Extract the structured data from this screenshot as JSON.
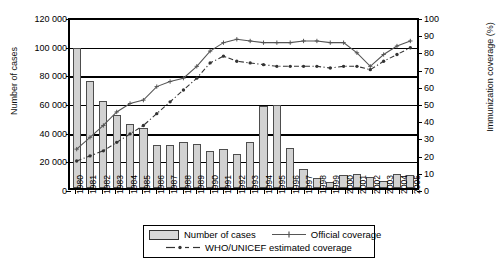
{
  "chart_data": {
    "type": "bar",
    "title": "",
    "xlabel": "",
    "ylabel": "Number of cases",
    "y2label": "Immunization coverage (%)",
    "ylim": [
      0,
      120000
    ],
    "y2lim": [
      0,
      100
    ],
    "grid": true,
    "legend_position": "bottom",
    "categories": [
      "1980",
      "1981",
      "1982",
      "1983",
      "1984",
      "1985",
      "1986",
      "1987",
      "1988",
      "1989",
      "1990",
      "1991",
      "1992",
      "1993",
      "1994",
      "1995",
      "1996",
      "1997",
      "1998",
      "1999",
      "2000",
      "2001",
      "2002",
      "2003",
      "2004",
      "2005"
    ],
    "y_ticks": [
      "0",
      "20 000",
      "40 000",
      "60 000",
      "80 000",
      "100 000",
      "120 000"
    ],
    "y_tick_values": [
      0,
      20000,
      40000,
      60000,
      80000,
      100000,
      120000
    ],
    "y2_ticks": [
      "0",
      "10",
      "20",
      "30",
      "40",
      "50",
      "60",
      "70",
      "80",
      "90",
      "100"
    ],
    "y2_tick_values": [
      0,
      10,
      20,
      30,
      40,
      50,
      60,
      70,
      80,
      90,
      100
    ],
    "series": [
      {
        "name": "Number of cases",
        "type": "bar",
        "axis": "left",
        "color": "#d2d2d2",
        "border_color": "#4d4d4d",
        "values": [
          98000,
          75000,
          61000,
          51000,
          45000,
          42000,
          30000,
          30000,
          32000,
          31000,
          26000,
          27000,
          24000,
          32000,
          57000,
          58000,
          28000,
          13000,
          7000,
          4000,
          9000,
          10000,
          8000,
          5000,
          10000,
          9000
        ]
      },
      {
        "name": "Official coverage",
        "type": "line",
        "axis": "right",
        "color": "#555555",
        "style": "solid",
        "marker": "plus",
        "values": [
          23,
          30,
          37,
          45,
          50,
          52,
          60,
          63,
          65,
          72,
          81,
          86,
          88,
          87,
          86,
          86,
          86,
          87,
          87,
          86,
          86,
          80,
          72,
          79,
          84,
          87
        ]
      },
      {
        "name": "WHO/UNICEF estimated coverage",
        "type": "line",
        "axis": "right",
        "color": "#333333",
        "style": "dash-dot",
        "marker": "dot",
        "values": [
          16,
          19,
          22,
          27,
          32,
          37,
          44,
          51,
          58,
          65,
          74,
          78,
          75,
          74,
          73,
          72,
          72,
          72,
          72,
          71,
          72,
          72,
          70,
          75,
          79,
          83
        ]
      }
    ],
    "legend": [
      {
        "label": "Number of cases",
        "marker": "bar-swatch"
      },
      {
        "label": "Official coverage",
        "marker": "solid-line-plus"
      },
      {
        "label": "WHO/UNICEF estimated coverage",
        "marker": "dashed-line-dot"
      }
    ]
  }
}
